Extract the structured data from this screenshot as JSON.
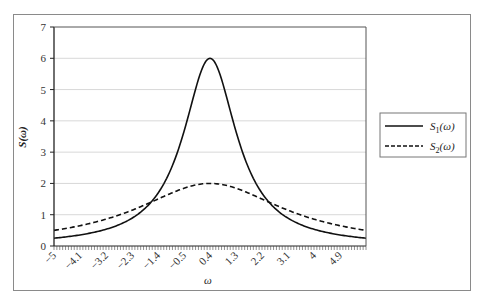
{
  "chart_data": {
    "type": "line",
    "title": "",
    "xlabel": "ω",
    "ylabel": "S(ω)",
    "xlim": [
      -5,
      5.8
    ],
    "ylim": [
      0,
      7
    ],
    "grid": true,
    "legend_position": "right",
    "x_tick_labels": [
      "−5",
      "−4.1",
      "−3.2",
      "−2.3",
      "−1.4",
      "−0.5",
      "0.4",
      "1.3",
      "2.2",
      "3.1",
      "4",
      "4.9"
    ],
    "y_tick_labels": [
      "0",
      "1",
      "2",
      "3",
      "4",
      "5",
      "6",
      "7"
    ],
    "x": [
      -5,
      -4.1,
      -3.2,
      -2.3,
      -1.4,
      -0.5,
      0.4,
      1.3,
      2.2,
      3.1,
      4,
      4.9,
      5.8
    ],
    "series": [
      {
        "name": "S1(ω)",
        "label_main": "S",
        "label_sub": "1",
        "label_arg": "(ω)",
        "style": "solid",
        "peak": 6,
        "center": 0.4,
        "width": 1.126,
        "values": [
          0.25,
          0.36,
          0.55,
          0.97,
          1.93,
          3.66,
          6.0,
          3.66,
          1.93,
          0.97,
          0.55,
          0.36,
          0.25
        ]
      },
      {
        "name": "S2(ω)",
        "label_main": "S",
        "label_sub": "2",
        "label_arg": "(ω)",
        "style": "dashed",
        "peak": 2,
        "center": 0.4,
        "width": 3.12,
        "values": [
          0.5,
          0.65,
          0.86,
          1.13,
          1.45,
          1.85,
          2.0,
          1.85,
          1.45,
          1.13,
          0.86,
          0.65,
          0.5
        ]
      }
    ]
  }
}
